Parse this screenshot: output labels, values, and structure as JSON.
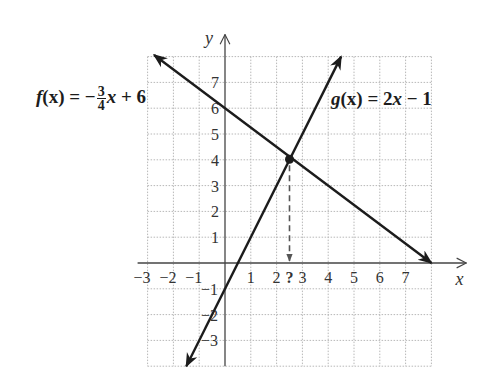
{
  "chart_data": {
    "type": "line",
    "title": "",
    "xlabel": "x",
    "ylabel": "y",
    "xlim": [
      -3,
      8
    ],
    "ylim": [
      -4,
      8
    ],
    "grid": true,
    "grid_style": "dotted",
    "x_ticks": [
      "-3",
      "-2",
      "-1",
      "1",
      "2",
      "?",
      "3",
      "4",
      "5",
      "6",
      "7"
    ],
    "y_ticks": [
      "7",
      "6",
      "5",
      "4",
      "3",
      "2",
      "1",
      "-1",
      "-2",
      "-3"
    ],
    "series": [
      {
        "name": "f(x) = -3/4 x + 6",
        "slope": -0.75,
        "intercept": 6,
        "x": [
          -2.75,
          8
        ],
        "y": [
          8.0625,
          0
        ]
      },
      {
        "name": "g(x) = 2x - 1",
        "slope": 2,
        "intercept": -1,
        "x": [
          -1.5,
          4.5
        ],
        "y": [
          -4,
          8
        ]
      }
    ],
    "annotations": [
      {
        "type": "point",
        "label": "intersection",
        "x": 2.5,
        "y": 4.1
      },
      {
        "type": "dashed-arrow",
        "from": [
          2.5,
          4.1
        ],
        "to": [
          2.5,
          0
        ],
        "label": "?"
      }
    ]
  },
  "labels": {
    "f_prefix": "f",
    "f_paren": "(x) = −",
    "f_num": "3",
    "f_den": "4",
    "f_suffix_x": "x",
    "f_suffix": " + 6",
    "g_prefix": "g",
    "g_paren": "(x) = 2",
    "g_x": "x",
    "g_suffix": " − 1",
    "x_axis": "x",
    "y_axis": "y",
    "unknown_mark": "?"
  },
  "colors": {
    "line": "#1c1c1c",
    "grid": "#b8b8b8",
    "axis": "#444444"
  }
}
